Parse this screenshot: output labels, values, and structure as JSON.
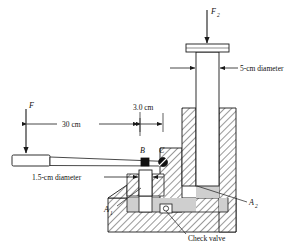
{
  "figure": {
    "kind": "engineering-diagram",
    "background_color": "#ffffff",
    "line_color": "#1a1a1a",
    "fluid_color": "#cfcfcf",
    "hatch_color": "#333333"
  },
  "labels": {
    "force_applied": "F",
    "force_output": "F",
    "force_output_subscript": "2",
    "dim_lever_length": "30 cm",
    "dim_pivot_offset": "3.0 cm",
    "dim_large_piston": "5-cm diameter",
    "dim_small_piston": "1.5-cm diameter",
    "point_b": "B",
    "point_c": "C",
    "area_small": "A",
    "area_small_subscript": "1",
    "area_large": "A",
    "area_large_subscript": "2",
    "check_valve": "Check valve"
  },
  "geometry": {
    "large_piston_diameter_cm": 5,
    "small_piston_diameter_cm": 1.5,
    "lever_length_cm": 30,
    "pivot_offset_cm": 3.0
  }
}
